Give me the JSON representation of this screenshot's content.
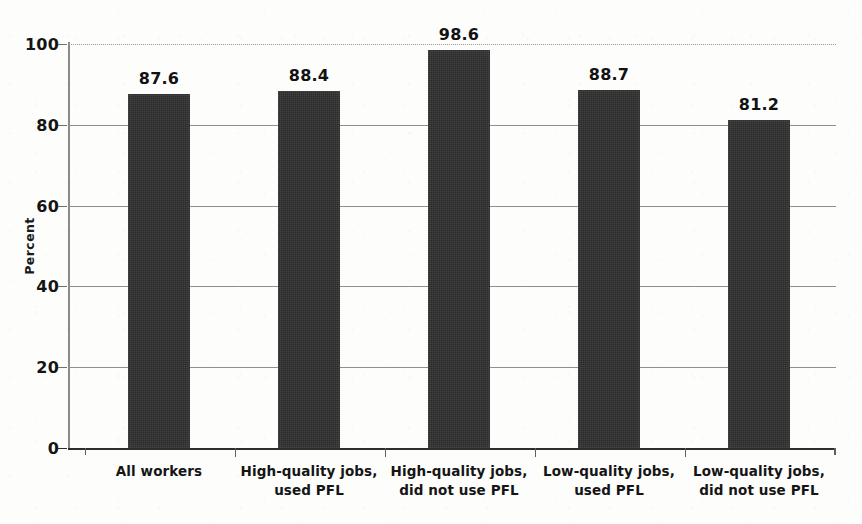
{
  "chart_data": {
    "type": "bar",
    "title": "",
    "subtitle": "",
    "xlabel": "",
    "ylabel": "Percent",
    "ylim": [
      0,
      100
    ],
    "yticks": [
      0,
      20,
      40,
      60,
      80,
      100
    ],
    "grid": true,
    "legend": "none",
    "categories": [
      "All workers",
      "High-quality jobs,\nused PFL",
      "High-quality jobs,\ndid not use PFL",
      "Low-quality jobs,\nused PFL",
      "Low-quality jobs,\ndid not use PFL"
    ],
    "values": [
      87.6,
      88.4,
      98.6,
      88.7,
      81.2
    ],
    "value_labels": [
      "87.6",
      "88.4",
      "98.6",
      "88.7",
      "81.2"
    ],
    "bar_color": "#2a2a2a",
    "gridline_color": "#8f8f8f",
    "axis_color": "#6f6f6f",
    "background_color": "#fdfdfc"
  },
  "axis": {
    "y_tick_labels": [
      "100",
      "80",
      "60",
      "40",
      "20",
      "0"
    ],
    "y_title": "Percent"
  }
}
